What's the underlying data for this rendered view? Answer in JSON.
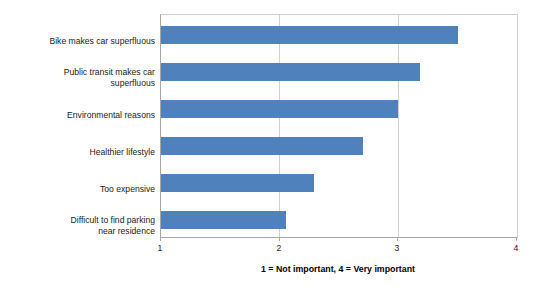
{
  "chart_data": {
    "type": "bar",
    "orientation": "horizontal",
    "title": "",
    "xlabel": "1 = Not important, 4 = Very important",
    "ylabel": "",
    "xlim": [
      1,
      4
    ],
    "xticks": [
      "1",
      "2",
      "3",
      "4"
    ],
    "grid": "vertical-only",
    "legend": "none",
    "bar_color": "#4f81bd",
    "categories": [
      "Bike makes car superfluous",
      "Public transit makes car\nsuperfluous",
      "Environmental reasons",
      "Healthier lifestyle",
      "Too expensive",
      "Difficult to find parking\nnear residence"
    ],
    "values": [
      3.5,
      3.18,
      3.0,
      2.7,
      2.29,
      2.05
    ]
  },
  "axis": {
    "title": "1 = Not important, 4 = Very important",
    "ticks": [
      "1",
      "2",
      "3",
      "4"
    ]
  }
}
